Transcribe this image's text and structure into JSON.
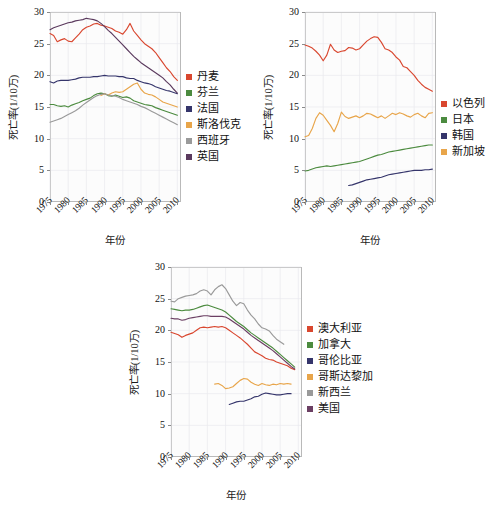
{
  "figure": {
    "y_axis_label": "死亡率(1/10万)",
    "x_axis_label": "年份",
    "y_ticks": [
      "0",
      "5",
      "10",
      "15",
      "20",
      "25",
      "30"
    ],
    "x_ticks": [
      "1975",
      "1980",
      "1985",
      "1990",
      "1995",
      "2000",
      "2005",
      "2010"
    ]
  },
  "palette": {
    "red": "#d9472f",
    "orange_red": "#e05a38",
    "green": "#4c8b3f",
    "navy": "#35356b",
    "tan": "#e8a54a",
    "gray": "#9a9a9a",
    "purple": "#6b3f63",
    "dark_purple": "#5b3a5e"
  },
  "chart_data": [
    {
      "type": "line",
      "title": "",
      "xlabel": "年份",
      "ylabel": "死亡率(1/10万)",
      "xlim": [
        1975,
        2011
      ],
      "ylim": [
        0,
        30
      ],
      "grid": true,
      "legend_position": "right",
      "x": [
        1975,
        1976,
        1977,
        1978,
        1979,
        1980,
        1981,
        1982,
        1983,
        1984,
        1985,
        1986,
        1987,
        1988,
        1989,
        1990,
        1991,
        1992,
        1993,
        1994,
        1995,
        1996,
        1997,
        1998,
        1999,
        2000,
        2001,
        2002,
        2003,
        2004,
        2005,
        2006,
        2007,
        2008,
        2009,
        2010
      ],
      "series": [
        {
          "name": "丹麦",
          "color": "#d9472f",
          "values": [
            26.6,
            26.3,
            25.3,
            25.6,
            25.8,
            25.4,
            25.3,
            25.9,
            26.5,
            27.2,
            27.6,
            27.8,
            28.1,
            28.2,
            27.9,
            27.8,
            27.6,
            27.4,
            27.0,
            26.8,
            26.5,
            27.2,
            28.2,
            27.0,
            26.3,
            25.6,
            25.0,
            24.6,
            24.2,
            23.6,
            22.8,
            22.0,
            21.2,
            20.6,
            19.8,
            19.2
          ]
        },
        {
          "name": "芬兰",
          "color": "#4c8b3f",
          "values": [
            15.4,
            15.4,
            15.2,
            15.1,
            15.2,
            15.0,
            15.3,
            15.5,
            15.7,
            16.0,
            16.2,
            16.4,
            16.8,
            17.1,
            17.2,
            17.1,
            16.8,
            16.7,
            16.9,
            16.7,
            16.5,
            16.6,
            16.4,
            16.0,
            15.8,
            15.6,
            15.4,
            15.3,
            15.2,
            14.9,
            14.7,
            14.5,
            14.3,
            14.1,
            13.9,
            13.7
          ]
        },
        {
          "name": "法国",
          "color": "#35356b",
          "values": [
            19.0,
            18.8,
            19.1,
            19.2,
            19.2,
            19.2,
            19.3,
            19.4,
            19.6,
            19.7,
            19.7,
            19.7,
            19.8,
            19.8,
            19.9,
            20.0,
            19.9,
            19.9,
            19.9,
            19.8,
            19.8,
            19.6,
            19.5,
            19.5,
            19.2,
            19.0,
            18.8,
            18.7,
            18.5,
            18.2,
            18.0,
            17.8,
            17.6,
            17.5,
            17.3,
            17.1
          ]
        },
        {
          "name": "斯洛伐克",
          "color": "#e8a54a",
          "values": [
            null,
            null,
            null,
            null,
            null,
            null,
            null,
            null,
            null,
            null,
            null,
            null,
            null,
            null,
            16.8,
            17.1,
            16.9,
            17.2,
            17.4,
            17.3,
            17.4,
            17.8,
            18.2,
            18.6,
            18.8,
            17.8,
            17.2,
            17.0,
            16.9,
            16.6,
            16.2,
            15.8,
            15.6,
            15.4,
            15.2,
            15.0
          ]
        },
        {
          "name": "西班牙",
          "color": "#9a9a9a",
          "values": [
            12.6,
            12.8,
            13.0,
            13.2,
            13.5,
            13.8,
            14.1,
            14.4,
            14.8,
            15.3,
            15.7,
            16.1,
            16.5,
            16.8,
            17.0,
            17.1,
            16.9,
            16.8,
            16.7,
            16.5,
            16.2,
            16.0,
            15.8,
            15.6,
            15.4,
            15.1,
            14.9,
            14.6,
            14.3,
            14.0,
            13.7,
            13.4,
            13.1,
            12.8,
            12.5,
            12.2
          ]
        },
        {
          "name": "英国",
          "color": "#5b3a5e",
          "values": [
            27.2,
            27.5,
            27.7,
            27.9,
            28.1,
            28.3,
            28.4,
            28.6,
            28.7,
            28.8,
            29.0,
            28.9,
            28.8,
            28.6,
            28.2,
            27.7,
            27.1,
            26.6,
            26.0,
            25.4,
            24.8,
            24.2,
            23.6,
            23.0,
            22.5,
            22.0,
            21.6,
            21.2,
            20.8,
            20.4,
            20.0,
            19.6,
            19.0,
            18.5,
            17.8,
            17.2
          ]
        }
      ]
    },
    {
      "type": "line",
      "title": "",
      "xlabel": "年份",
      "ylabel": "死亡率(1/10万)",
      "xlim": [
        1975,
        2011
      ],
      "ylim": [
        0,
        30
      ],
      "grid": true,
      "legend_position": "right",
      "x": [
        1975,
        1976,
        1977,
        1978,
        1979,
        1980,
        1981,
        1982,
        1983,
        1984,
        1985,
        1986,
        1987,
        1988,
        1989,
        1990,
        1991,
        1992,
        1993,
        1994,
        1995,
        1996,
        1997,
        1998,
        1999,
        2000,
        2001,
        2002,
        2003,
        2004,
        2005,
        2006,
        2007,
        2008,
        2009,
        2010
      ],
      "series": [
        {
          "name": "以色列",
          "color": "#d9472f",
          "values": [
            24.8,
            24.6,
            24.3,
            23.8,
            23.2,
            22.3,
            23.2,
            24.9,
            24.0,
            23.6,
            23.8,
            23.9,
            24.4,
            24.3,
            24.0,
            24.2,
            24.8,
            25.4,
            25.8,
            26.1,
            26.0,
            25.2,
            24.2,
            24.0,
            23.6,
            22.9,
            22.4,
            21.4,
            21.2,
            20.6,
            20.0,
            19.2,
            18.6,
            18.1,
            17.8,
            17.5
          ]
        },
        {
          "name": "日本",
          "color": "#4c8b3f",
          "values": [
            4.9,
            5.0,
            5.2,
            5.4,
            5.5,
            5.6,
            5.7,
            5.6,
            5.7,
            5.8,
            5.9,
            6.0,
            6.1,
            6.2,
            6.3,
            6.4,
            6.6,
            6.8,
            7.0,
            7.2,
            7.4,
            7.5,
            7.7,
            7.9,
            8.0,
            8.1,
            8.2,
            8.3,
            8.4,
            8.5,
            8.6,
            8.7,
            8.8,
            8.9,
            9.0,
            9.0
          ]
        },
        {
          "name": "韩国",
          "color": "#35356b",
          "values": [
            null,
            null,
            null,
            null,
            null,
            null,
            null,
            null,
            null,
            null,
            null,
            null,
            2.6,
            2.7,
            2.9,
            3.1,
            3.3,
            3.5,
            3.6,
            3.7,
            3.8,
            3.9,
            4.1,
            4.3,
            4.4,
            4.5,
            4.6,
            4.7,
            4.8,
            4.9,
            5.0,
            5.0,
            5.0,
            5.1,
            5.1,
            5.2
          ]
        },
        {
          "name": "新加坡",
          "color": "#e8a54a",
          "values": [
            10.3,
            10.5,
            11.6,
            13.2,
            14.1,
            13.7,
            12.9,
            12.1,
            11.1,
            12.4,
            14.2,
            13.5,
            13.2,
            13.4,
            13.6,
            13.3,
            13.6,
            14.0,
            13.9,
            13.6,
            13.3,
            13.6,
            13.2,
            13.6,
            14.0,
            13.8,
            14.1,
            13.9,
            13.6,
            13.4,
            13.8,
            14.0,
            13.6,
            13.3,
            14.0,
            14.1
          ]
        }
      ]
    },
    {
      "type": "line",
      "title": "",
      "xlabel": "年份",
      "ylabel": "死亡率(1/10万)",
      "xlim": [
        1975,
        2011
      ],
      "ylim": [
        0,
        30
      ],
      "grid": true,
      "legend_position": "right",
      "x": [
        1975,
        1976,
        1977,
        1978,
        1979,
        1980,
        1981,
        1982,
        1983,
        1984,
        1985,
        1986,
        1987,
        1988,
        1989,
        1990,
        1991,
        1992,
        1993,
        1994,
        1995,
        1996,
        1997,
        1998,
        1999,
        2000,
        2001,
        2002,
        2003,
        2004,
        2005,
        2006,
        2007,
        2008,
        2009,
        2010
      ],
      "series": [
        {
          "name": "澳大利亚",
          "color": "#d9472f",
          "values": [
            19.7,
            19.5,
            19.3,
            18.9,
            19.2,
            19.4,
            19.6,
            20.0,
            20.4,
            20.5,
            20.4,
            20.5,
            20.6,
            20.5,
            20.6,
            20.4,
            20.0,
            19.6,
            19.2,
            18.8,
            18.3,
            17.8,
            17.2,
            16.6,
            16.3,
            16.0,
            15.6,
            15.4,
            15.3,
            15.0,
            14.8,
            14.6,
            14.4,
            14.0,
            13.8,
            null
          ]
        },
        {
          "name": "加拿大",
          "color": "#4c8b3f",
          "values": [
            23.4,
            23.3,
            23.2,
            23.1,
            23.2,
            23.2,
            23.3,
            23.5,
            23.7,
            23.9,
            24.0,
            23.8,
            23.6,
            23.4,
            23.2,
            22.9,
            22.4,
            21.9,
            21.4,
            21.0,
            20.6,
            20.1,
            19.6,
            19.2,
            18.8,
            18.4,
            18.0,
            17.6,
            17.2,
            16.7,
            16.2,
            15.7,
            15.2,
            14.7,
            14.2,
            null
          ]
        },
        {
          "name": "哥伦比亚",
          "color": "#35356b",
          "values": [
            null,
            null,
            null,
            null,
            null,
            null,
            null,
            null,
            null,
            null,
            null,
            null,
            null,
            null,
            null,
            null,
            8.3,
            8.5,
            8.7,
            8.8,
            8.8,
            9.0,
            9.2,
            9.5,
            9.6,
            9.9,
            10.1,
            10.0,
            9.9,
            9.8,
            9.8,
            9.9,
            10.0,
            10.0,
            null,
            null
          ]
        },
        {
          "name": "哥斯达黎加",
          "color": "#e8a54a",
          "values": [
            null,
            null,
            null,
            null,
            null,
            null,
            null,
            null,
            null,
            null,
            null,
            null,
            11.5,
            11.6,
            11.3,
            10.8,
            10.9,
            11.1,
            11.6,
            12.1,
            12.4,
            12.3,
            11.8,
            11.5,
            11.3,
            11.6,
            11.4,
            11.3,
            11.5,
            11.4,
            11.6,
            11.5,
            11.6,
            11.5,
            null,
            null
          ]
        },
        {
          "name": "新西兰",
          "color": "#9a9a9a",
          "values": [
            24.6,
            24.5,
            25.0,
            25.2,
            25.4,
            25.5,
            25.6,
            25.8,
            26.2,
            26.4,
            26.2,
            25.6,
            26.4,
            26.9,
            27.2,
            26.6,
            25.6,
            24.6,
            23.9,
            24.4,
            24.2,
            23.2,
            22.4,
            21.8,
            21.0,
            20.4,
            20.2,
            19.9,
            19.2,
            18.6,
            18.2,
            17.8,
            null,
            null,
            null,
            null
          ]
        },
        {
          "name": "美国",
          "color": "#6b3f63",
          "values": [
            21.9,
            21.8,
            21.8,
            21.6,
            21.7,
            21.9,
            22.0,
            22.1,
            22.2,
            22.3,
            22.3,
            22.2,
            22.2,
            22.2,
            22.2,
            22.1,
            21.8,
            21.4,
            21.0,
            20.6,
            20.2,
            19.7,
            19.2,
            18.8,
            18.4,
            18.0,
            17.6,
            17.2,
            16.8,
            16.3,
            15.8,
            15.3,
            14.8,
            14.3,
            13.9,
            null
          ]
        }
      ]
    }
  ]
}
